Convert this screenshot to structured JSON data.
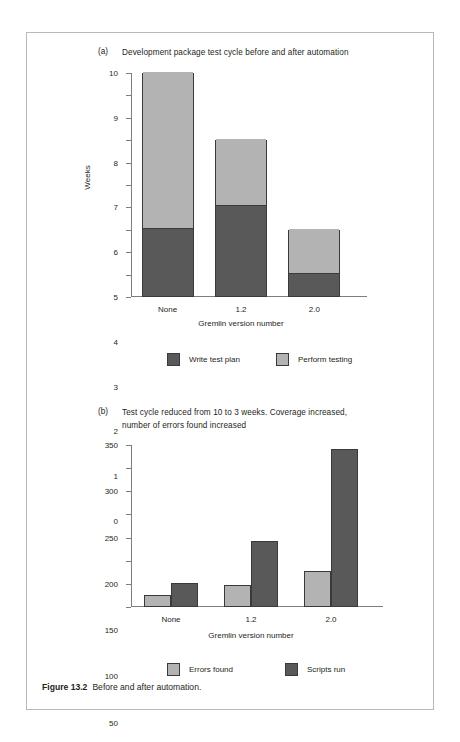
{
  "figure": {
    "caption_bold": "Figure 13.2",
    "caption_text": "Before and after automation."
  },
  "panel_a": {
    "label": "(a)",
    "caption": "Development package test cycle before and after automation"
  },
  "panel_b": {
    "label": "(b)",
    "caption": "Test cycle reduced from 10 to 3 weeks. Coverage increased,\nnumber of errors found increased"
  },
  "colors": {
    "dark": "#595959",
    "light": "#b3b3b3",
    "axis": "#7d7d7d",
    "bar_border": "#3a3a3a",
    "box_border": "#b9b9b9",
    "text": "#231f20"
  },
  "chart_data": [
    {
      "id": "chart-a",
      "type": "bar",
      "stacked": true,
      "title": "Development package test cycle before and after automation",
      "xlabel": "Gremlin version number",
      "ylabel": "Weeks",
      "categories": [
        "None",
        "1.2",
        "2.0"
      ],
      "ylim": [
        0,
        10
      ],
      "yticks": [
        0,
        1,
        2,
        3,
        4,
        5,
        6,
        7,
        8,
        9,
        10
      ],
      "grid": false,
      "legend_position": "bottom",
      "series": [
        {
          "name": "Write test plan",
          "color": "#595959",
          "values": [
            3,
            4,
            1
          ]
        },
        {
          "name": "Perform testing",
          "color": "#b3b3b3",
          "values": [
            7,
            3,
            2
          ]
        }
      ],
      "totals": [
        10,
        7,
        3
      ]
    },
    {
      "id": "chart-b",
      "type": "bar",
      "stacked": false,
      "title": "Test cycle reduced from 10 to 3 weeks. Coverage increased, number of errors found increased",
      "xlabel": "Gremlin version number",
      "ylabel": "",
      "categories": [
        "None",
        "1.2",
        "2.0"
      ],
      "ylim": [
        0,
        350
      ],
      "yticks": [
        0,
        50,
        100,
        150,
        200,
        250,
        300,
        350
      ],
      "grid": false,
      "legend_position": "bottom",
      "series": [
        {
          "name": "Errors found",
          "color": "#b3b3b3",
          "values": [
            27,
            47,
            78
          ]
        },
        {
          "name": "Scripts run",
          "color": "#595959",
          "values": [
            51,
            143,
            341
          ]
        }
      ]
    }
  ]
}
